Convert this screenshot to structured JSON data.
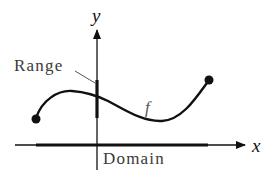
{
  "diagram": {
    "labels": {
      "y_axis": "y",
      "x_axis": "x",
      "range": "Range",
      "domain": "Domain",
      "function": "f"
    },
    "colors": {
      "axes": "#111111",
      "curve": "#111111",
      "label_text": "#3a3a3a",
      "background": "#ffffff"
    },
    "elements": [
      {
        "type": "axis",
        "name": "x-axis",
        "direction": "horizontal",
        "arrow": "right"
      },
      {
        "type": "axis",
        "name": "y-axis",
        "direction": "vertical",
        "arrow": "up"
      },
      {
        "type": "curve",
        "name": "function-f",
        "endpoints": "closed dots"
      },
      {
        "type": "segment",
        "name": "domain-segment",
        "on": "x-axis"
      },
      {
        "type": "segment",
        "name": "range-segment",
        "on": "y-axis"
      }
    ]
  }
}
